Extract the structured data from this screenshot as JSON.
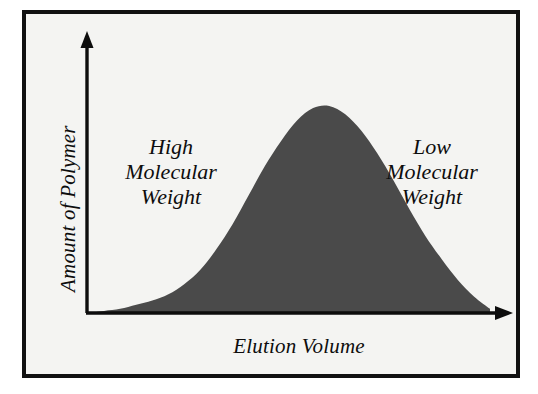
{
  "figure": {
    "background_color": "#f4f4f2",
    "frame_color": "#111111",
    "ink_color": "#0d0d0d"
  },
  "axes": {
    "y_title": "Amount of Polymer",
    "x_title": "Elution Volume",
    "y_arrow_name": "y-axis-arrowhead",
    "x_arrow_name": "x-axis-arrowhead"
  },
  "annotations": {
    "left": {
      "line1": "High",
      "line2": "Molecular",
      "line3": "Weight"
    },
    "right": {
      "line1": "Low",
      "line2": "Molecular",
      "line3": "Weight"
    }
  },
  "chart_data": {
    "type": "area",
    "title": "",
    "subtitle": "",
    "xlabel": "Elution Volume",
    "ylabel": "Amount of Polymer",
    "grid": false,
    "legend": null,
    "axis_style": "arrow-headed open axes, no tick marks, no tick labels",
    "fill_color": "#4a4a4a",
    "line_color": "#4a4a4a",
    "xlim": [
      0,
      100
    ],
    "ylim": [
      0,
      100
    ],
    "annotations": [
      {
        "text": "High Molecular Weight",
        "x": 18,
        "y": 72
      },
      {
        "text": "Low Molecular Weight",
        "x": 82,
        "y": 72
      }
    ],
    "x": [
      0,
      4,
      8,
      12,
      16,
      20,
      24,
      28,
      32,
      36,
      40,
      44,
      48,
      52,
      56,
      60,
      64,
      68,
      72,
      76,
      80,
      84,
      88,
      92,
      96,
      100
    ],
    "y": [
      0,
      1,
      2,
      4,
      6,
      9,
      14,
      21,
      31,
      43,
      57,
      71,
      83,
      93,
      99,
      100,
      96,
      88,
      77,
      64,
      50,
      37,
      26,
      16,
      8,
      2
    ],
    "series": [
      {
        "name": "Molecular weight distribution",
        "x": [
          0,
          4,
          8,
          12,
          16,
          20,
          24,
          28,
          32,
          36,
          40,
          44,
          48,
          52,
          56,
          60,
          64,
          68,
          72,
          76,
          80,
          84,
          88,
          92,
          96,
          100
        ],
        "values": [
          0,
          1,
          2,
          4,
          6,
          9,
          14,
          21,
          31,
          43,
          57,
          71,
          83,
          93,
          99,
          100,
          96,
          88,
          77,
          64,
          50,
          37,
          26,
          16,
          8,
          2
        ]
      }
    ]
  }
}
